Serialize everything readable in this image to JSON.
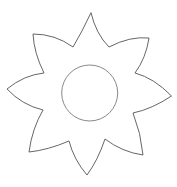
{
  "figure": {
    "petal_count": 8,
    "colors": {
      "background": "#ffffff",
      "petal_stroke": "#555555",
      "center_stroke": "#7a7a7a"
    },
    "center": {
      "cx": 89.7,
      "cy": 93,
      "r": 28
    },
    "petal_path": "M91,12.7 Q96,34 109,47 Q130,36 149,38 Q146,58 135,73 Q154,78 171.5,96 Q152,109 133,113 Q141,133 143,155 Q122,152 105,139 Q98,160 87,175 Q74,160 69,141 Q48,150 29,152 Q32,129 43,110 Q22,105 7,89 Q24,75 44,73 Q34,53 33,34 Q55,34 73,47 Q82,32 91,12.7 Z"
  }
}
